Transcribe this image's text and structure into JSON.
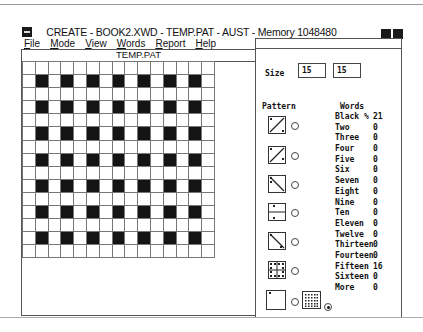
{
  "window": {
    "title": "CREATE - BOOK2.XWD - TEMP.PAT - AUST - Memory 1048480"
  },
  "menu": {
    "items": [
      {
        "label": "File",
        "mnemonic": "F",
        "rest": "ile"
      },
      {
        "label": "Mode",
        "mnemonic": "M",
        "rest": "ode"
      },
      {
        "label": "View",
        "mnemonic": "V",
        "rest": "iew"
      },
      {
        "label": "Words",
        "mnemonic": "W",
        "rest": "ords"
      },
      {
        "label": "Report",
        "mnemonic": "R",
        "rest": "eport"
      },
      {
        "label": "Help",
        "mnemonic": "H",
        "rest": "elp"
      }
    ]
  },
  "grid_pane": {
    "title": "TEMP.PAT",
    "rows": 15,
    "cols": 15,
    "black_rule": "odd row and odd column (0-indexed)"
  },
  "settings": {
    "size_label": "Size",
    "size_rows": "15",
    "size_cols": "15",
    "pattern_label": "Pattern",
    "patterns": [
      {
        "name": "diagonal-rising",
        "selected": false
      },
      {
        "name": "diagonal-rising-alt",
        "selected": false
      },
      {
        "name": "diagonal-falling",
        "selected": false
      },
      {
        "name": "horizontal-split",
        "selected": false
      },
      {
        "name": "diagonal-falling-alt",
        "selected": false
      },
      {
        "name": "quad-split",
        "selected": false
      },
      {
        "name": "single-corner",
        "selected": false
      },
      {
        "name": "dotted-grid",
        "selected": true
      }
    ]
  },
  "words": {
    "header": "Words",
    "rows": [
      {
        "label": "Black %",
        "value": "21"
      },
      {
        "label": "Two",
        "value": "0"
      },
      {
        "label": "Three",
        "value": "0"
      },
      {
        "label": "Four",
        "value": "0"
      },
      {
        "label": "Five",
        "value": "0"
      },
      {
        "label": "Six",
        "value": "0"
      },
      {
        "label": "Seven",
        "value": "0"
      },
      {
        "label": "Eight",
        "value": "0"
      },
      {
        "label": "Nine",
        "value": "0"
      },
      {
        "label": "Ten",
        "value": "0"
      },
      {
        "label": "Eleven",
        "value": "0"
      },
      {
        "label": "Twelve",
        "value": "0"
      },
      {
        "label": "Thirteen",
        "value": "0"
      },
      {
        "label": "Fourteen",
        "value": "0"
      },
      {
        "label": "Fifteen",
        "value": "16"
      },
      {
        "label": "Sixteen",
        "value": "0"
      },
      {
        "label": "More",
        "value": "0"
      }
    ]
  }
}
